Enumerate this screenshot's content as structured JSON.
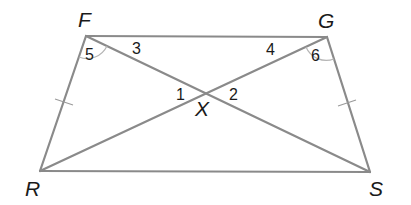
{
  "figure": {
    "type": "quadrilateral-with-diagonals",
    "vertices": {
      "F": {
        "label": "F"
      },
      "G": {
        "label": "G"
      },
      "R": {
        "label": "R"
      },
      "S": {
        "label": "S"
      },
      "X": {
        "label": "X"
      }
    },
    "segments": [
      {
        "from": "F",
        "to": "G",
        "name": "FG"
      },
      {
        "from": "G",
        "to": "S",
        "name": "GS"
      },
      {
        "from": "S",
        "to": "R",
        "name": "SR"
      },
      {
        "from": "R",
        "to": "F",
        "name": "RF"
      },
      {
        "from": "F",
        "to": "S",
        "name": "FS"
      },
      {
        "from": "G",
        "to": "R",
        "name": "GR"
      }
    ],
    "congruent_sides": [
      "FR",
      "GS"
    ],
    "angle_labels": {
      "a1": "1",
      "a2": "2",
      "a3": "3",
      "a4": "4",
      "a5": "5",
      "a6": "6"
    },
    "angle_arcs": [
      "angle 5 at F",
      "angle 6 at G"
    ],
    "line_color": "#8a8a8a",
    "text_color": "#1a1a1a"
  }
}
